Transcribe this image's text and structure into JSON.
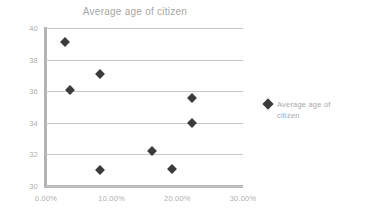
{
  "chart_data": {
    "type": "scatter",
    "title": "Average age of citizen",
    "xlabel": "",
    "ylabel": "",
    "xlim": [
      0,
      30
    ],
    "ylim": [
      30,
      40
    ],
    "grid": true,
    "legend_position": "right",
    "x_tick_labels": [
      "0.00%",
      "10.00%",
      "20.00%",
      "30.00%"
    ],
    "x_tick_values": [
      0,
      10,
      20,
      30
    ],
    "y_tick_labels": [
      "40",
      "38",
      "36",
      "34",
      "32",
      "30"
    ],
    "y_tick_values": [
      40,
      38,
      36,
      34,
      32,
      30
    ],
    "series": [
      {
        "name": "Average age of citizen",
        "marker": "diamond",
        "color": "#3b3b3b",
        "points": [
          {
            "x": 2.9,
            "y": 39.1
          },
          {
            "x": 3.7,
            "y": 36.1
          },
          {
            "x": 8.2,
            "y": 37.1
          },
          {
            "x": 8.2,
            "y": 31.0
          },
          {
            "x": 16.1,
            "y": 32.2
          },
          {
            "x": 19.2,
            "y": 31.1
          },
          {
            "x": 22.2,
            "y": 35.6
          },
          {
            "x": 22.2,
            "y": 34.0
          }
        ]
      }
    ]
  },
  "legend": {
    "entries": [
      {
        "label": "Average age of citizen"
      }
    ]
  },
  "colors": {
    "marker": "#3b3b3b",
    "gridline": "#c9c9c9",
    "axis": "#b4b4b4",
    "tick_text": "#b0b0b0",
    "title_text": "#a6a6a6",
    "background": "#ffffff"
  }
}
